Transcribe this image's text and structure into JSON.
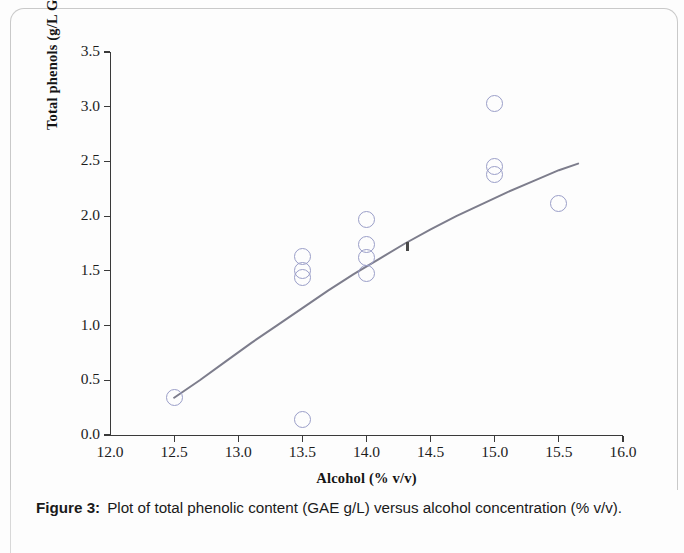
{
  "figure": {
    "caption_label": "Figure 3:",
    "caption_text": "Plot of total phenolic content (GAE g/L) versus alcohol concentration (% v/v)."
  },
  "chart_data": {
    "type": "scatter",
    "title": "",
    "xlabel": "Alcohol (% v/v)",
    "ylabel": "Total phenols (g/L GAE)",
    "xlim": [
      12.0,
      16.0
    ],
    "ylim": [
      0.0,
      3.5
    ],
    "xticks": [
      "12.0",
      "12.5",
      "13.0",
      "13.5",
      "14.0",
      "14.5",
      "15.0",
      "15.5",
      "16.0"
    ],
    "xtick_values": [
      12.0,
      12.5,
      13.0,
      13.5,
      14.0,
      14.5,
      15.0,
      15.5,
      16.0
    ],
    "yticks": [
      "0.0",
      "0.5",
      "1.0",
      "1.5",
      "2.0",
      "2.5",
      "3.0",
      "3.5"
    ],
    "ytick_values": [
      0.0,
      0.5,
      1.0,
      1.5,
      2.0,
      2.5,
      3.0,
      3.5
    ],
    "grid": false,
    "legend": false,
    "marker": "open-circle",
    "marker_color": "#9a9ec8",
    "line_color": "#7d7d8c",
    "axis_color": "#3a3a3a",
    "points": [
      {
        "x": 12.5,
        "y": 0.34
      },
      {
        "x": 13.5,
        "y": 1.63
      },
      {
        "x": 13.5,
        "y": 1.5
      },
      {
        "x": 13.5,
        "y": 1.44
      },
      {
        "x": 13.5,
        "y": 0.14
      },
      {
        "x": 14.0,
        "y": 1.97
      },
      {
        "x": 14.0,
        "y": 1.74
      },
      {
        "x": 14.0,
        "y": 1.62
      },
      {
        "x": 14.0,
        "y": 1.48
      },
      {
        "x": 15.0,
        "y": 3.03
      },
      {
        "x": 15.0,
        "y": 2.45
      },
      {
        "x": 15.0,
        "y": 2.38
      },
      {
        "x": 15.5,
        "y": 2.12
      }
    ],
    "artifact_marks": [
      {
        "x": 14.32,
        "y": 1.72
      }
    ],
    "trend_line": {
      "name": "fitted curve",
      "x": [
        12.5,
        12.7,
        12.9,
        13.1,
        13.3,
        13.5,
        13.7,
        13.9,
        14.1,
        14.3,
        14.5,
        14.7,
        14.9,
        15.1,
        15.3,
        15.5,
        15.65
      ],
      "y": [
        0.34,
        0.5,
        0.67,
        0.84,
        1.0,
        1.16,
        1.32,
        1.47,
        1.61,
        1.75,
        1.88,
        2.0,
        2.11,
        2.22,
        2.32,
        2.42,
        2.48
      ]
    }
  }
}
